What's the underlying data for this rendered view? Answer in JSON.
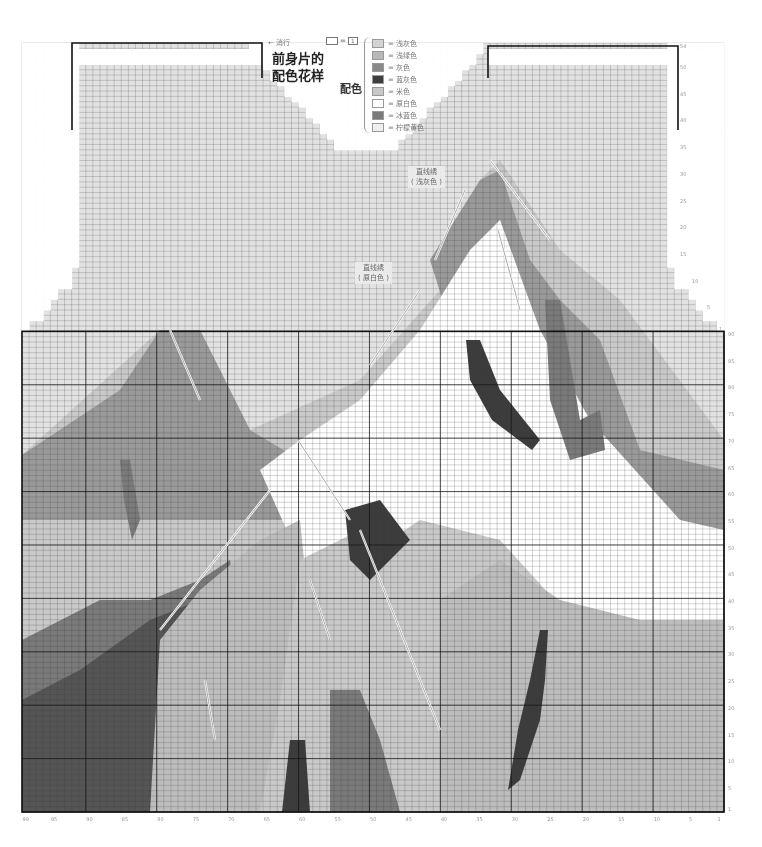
{
  "title": {
    "line1": "前身片的",
    "line2": "配色花样"
  },
  "end_label": "← 消行",
  "key": {
    "equals": "=",
    "symbol": "1"
  },
  "legend": {
    "title": "配色",
    "items": [
      {
        "label": "= 浅灰色",
        "color": "#d4d4d4"
      },
      {
        "label": "= 浅绿色",
        "color": "#b8b8b8"
      },
      {
        "label": "= 灰色",
        "color": "#8a8a8a"
      },
      {
        "label": "= 蓝灰色",
        "color": "#3e3e3e"
      },
      {
        "label": "= 米色",
        "color": "#c8c8c8"
      },
      {
        "label": "= 原白色",
        "color": "#ffffff"
      },
      {
        "label": "= 冰蓝色",
        "color": "#7a7a7a"
      },
      {
        "label": "= 柠檬黄色",
        "color": "#eeeeee"
      }
    ]
  },
  "callouts": [
    {
      "line1": "直线绣",
      "line2": "( 浅灰色 )"
    },
    {
      "line1": "直线绣",
      "line2": "( 原白色 )"
    }
  ],
  "chart_data": {
    "type": "table",
    "stitches": 99,
    "body_rows": 90,
    "armhole_rows": 54,
    "column_tick_labels": [
      "99",
      "95",
      "90",
      "85",
      "80",
      "75",
      "70",
      "65",
      "60",
      "55",
      "50",
      "45",
      "40",
      "35",
      "30",
      "25",
      "20",
      "15",
      "10",
      "5",
      "1"
    ],
    "body_row_tick_labels": [
      "1",
      "5",
      "10",
      "15",
      "20",
      "25",
      "30",
      "35",
      "40",
      "45",
      "50",
      "55",
      "60",
      "65",
      "70",
      "75",
      "80",
      "85",
      "90"
    ],
    "armhole_row_tick_labels": [
      "1",
      "5",
      "10",
      "15",
      "20",
      "25",
      "30",
      "35",
      "40",
      "45",
      "50",
      "54"
    ],
    "neck_row_tick_labels": [
      "1",
      "5",
      "10",
      "15",
      "20"
    ],
    "legend": [
      "浅灰色",
      "浅绿色",
      "灰色",
      "蓝灰色",
      "米色",
      "原白色",
      "冰蓝色",
      "柠檬黄色"
    ],
    "annotations": [
      "直线绣（浅灰色）",
      "直线绣（原白色）",
      "消行"
    ],
    "grid": true
  }
}
